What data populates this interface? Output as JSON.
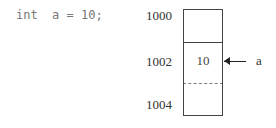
{
  "code": "int  a = 10;",
  "memory": {
    "addresses": [
      "1000",
      "1002",
      "1004"
    ],
    "value": "10",
    "variable": "a"
  }
}
